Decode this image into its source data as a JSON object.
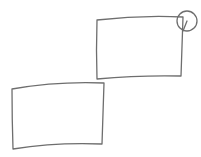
{
  "canvas": {
    "width": 201,
    "height": 157,
    "background": "#ffffff"
  },
  "style": {
    "stroke_color": "#6e6e6e",
    "stroke_width": 1.3
  },
  "shapes": [
    {
      "id": "rect-upper",
      "type": "sketch-rectangle",
      "path": "M97,20 Q140,15 183,17 Q182,47 181,76 Q140,75 97,79 Q96,50 97,20"
    },
    {
      "id": "rect-lower",
      "type": "sketch-rectangle",
      "path": "M12,89 Q58,81 104,83 Q103,114 102,144 Q57,142 13,149 Q12,119 12,89"
    },
    {
      "id": "corner-handle",
      "type": "sketch-circle",
      "cx": 187,
      "cy": 21,
      "r": 10
    },
    {
      "id": "handle-connector",
      "type": "line",
      "path": "M187,21 Q185,26 183,31"
    }
  ]
}
